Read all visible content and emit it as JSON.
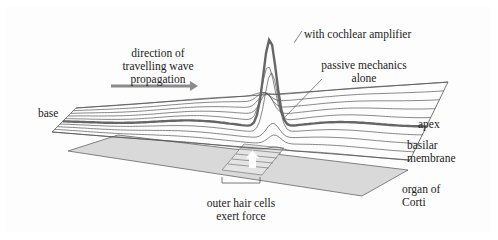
{
  "labels": {
    "direction_line1": "direction of",
    "direction_line2": "travelling wave",
    "direction_line3": "propagation",
    "with_amplifier": "with cochlear amplifier",
    "passive_line1": "passive mechanics",
    "passive_line2": "alone",
    "base": "base",
    "apex": "apex",
    "basilar_line1": "basilar",
    "basilar_line2": "membrane",
    "organ_line1": "organ of",
    "organ_line2": "Corti",
    "ohc_line1": "outer hair cells",
    "ohc_line2": "exert force"
  },
  "colors": {
    "arrow": "#8a8a8a",
    "membrane_line": "#555555",
    "thick_wave": "#666666",
    "organ_fill": "#d9d9d9",
    "text": "#222222"
  }
}
